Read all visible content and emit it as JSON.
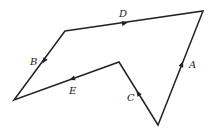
{
  "diagram": {
    "type": "closed polygon path with directed edges",
    "vertices": {
      "top_left": [
        65,
        31
      ],
      "top_right": [
        203,
        11
      ],
      "bottom_right": [
        158,
        125
      ],
      "inner_notch": [
        119,
        62
      ],
      "bottom_left": [
        14,
        100
      ]
    },
    "edges": [
      {
        "label": "D",
        "from": "top_left",
        "to": "top_right"
      },
      {
        "label": "A",
        "from": "bottom_right",
        "to": "top_right"
      },
      {
        "label": "C",
        "from": "bottom_right",
        "to": "inner_notch"
      },
      {
        "label": "E",
        "from": "inner_notch",
        "to": "bottom_left"
      },
      {
        "label": "B",
        "from": "top_left",
        "to": "bottom_left"
      }
    ],
    "labels": {
      "A": "A",
      "B": "B",
      "C": "C",
      "D": "D",
      "E": "E"
    },
    "stroke_color": "#222222"
  }
}
